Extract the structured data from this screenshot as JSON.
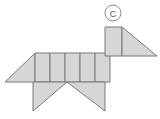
{
  "canvas": {
    "width": 160,
    "height": 119,
    "background": "#ffffff"
  },
  "figure": {
    "label": "C",
    "label_shape": "circle",
    "fill_color": "#d6d6d6",
    "stroke_color": "#7a7a7a",
    "stroke_width": 1
  },
  "label_marker": {
    "text": "C",
    "center_x": 113,
    "center_y": 13,
    "radius": 8,
    "stroke": "#8c8c8c",
    "text_color": "#555555"
  },
  "chart_data": {
    "type": "diagram",
    "pieces": [
      {
        "name": "tail-triangle",
        "shape": "triangle",
        "points": "5,82 35,53 35,82"
      },
      {
        "name": "body-square-1",
        "shape": "quadrilateral",
        "points": "35,53 50,53 50,82 35,82"
      },
      {
        "name": "body-square-2",
        "shape": "quadrilateral",
        "points": "50,53 65,53 65,82 50,82"
      },
      {
        "name": "body-square-3",
        "shape": "quadrilateral",
        "points": "65,53 80,53 80,82 65,82"
      },
      {
        "name": "body-square-4",
        "shape": "quadrilateral",
        "points": "80,53 95,53 95,82 80,82"
      },
      {
        "name": "body-square-5",
        "shape": "quadrilateral",
        "points": "95,53 110,53 110,82 95,82"
      },
      {
        "name": "rear-leg-triangle",
        "shape": "triangle",
        "points": "33,82 67,82 33,111"
      },
      {
        "name": "front-leg-triangle",
        "shape": "triangle",
        "points": "67,82 105,82 105,111"
      },
      {
        "name": "neck-rectangle",
        "shape": "quadrilateral",
        "points": "105,27 122,27 122,56 105,56"
      },
      {
        "name": "head-triangle",
        "shape": "triangle",
        "points": "122,27 157,56 122,56"
      }
    ],
    "legend": [],
    "annotations": [
      {
        "text": "C",
        "x": 113,
        "y": 13
      }
    ]
  }
}
